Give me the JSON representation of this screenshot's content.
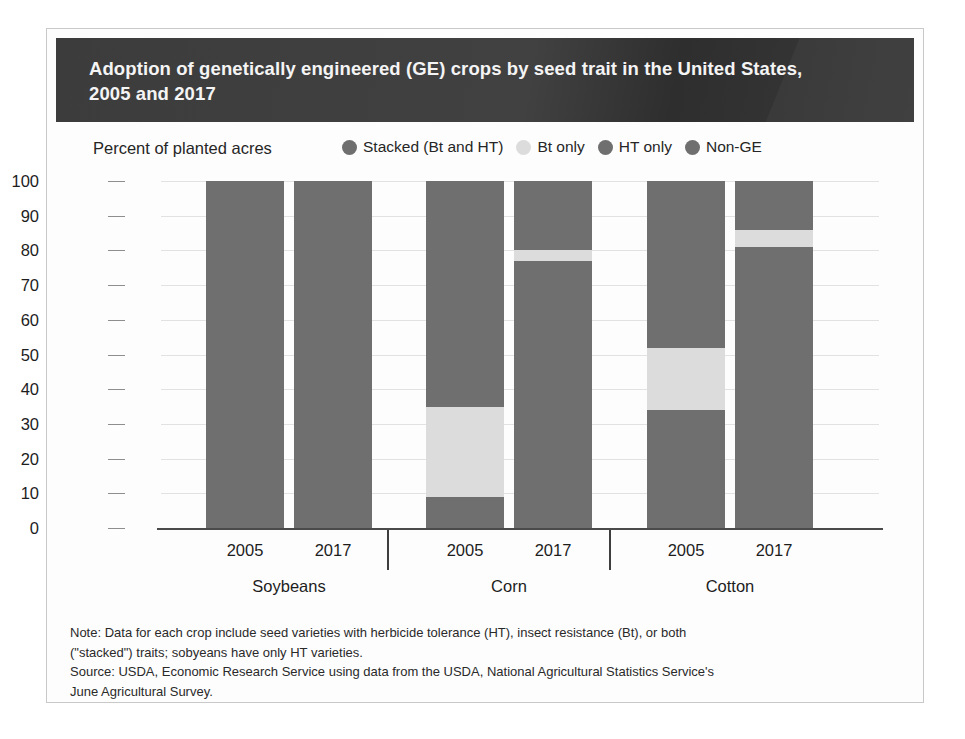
{
  "title": "Adoption of genetically engineered (GE) crops by seed trait in the United States,\n2005 and 2017",
  "axis_unit_label": "Percent of planted acres",
  "colors": {
    "stacked": "#6f6f6f",
    "bt_only": "#dcdcdc",
    "ht_only": "#6f6f6f",
    "non_ge": "#6f6f6f",
    "banner": "#3c3c3c",
    "gridline": "#e2e2e2",
    "axis": "#4a4a4a"
  },
  "legend": [
    {
      "label": "Stacked (Bt and HT)",
      "color": "#6f6f6f"
    },
    {
      "label": "Bt only",
      "color": "#dcdcdc"
    },
    {
      "label": "HT only",
      "color": "#6f6f6f"
    },
    {
      "label": "Non-GE",
      "color": "#6f6f6f"
    }
  ],
  "footnote": {
    "note": "Note: Data for each crop include seed varieties with herbicide tolerance (HT), insect resistance (Bt), or both\n(\"stacked\") traits; sobyeans have only HT varieties.",
    "source": "Source: USDA, Economic Research Service using data from the USDA, National Agricultural Statistics Service's\nJune Agricultural Survey."
  },
  "chart_data": {
    "type": "bar",
    "title": "Adoption of genetically engineered (GE) crops by seed trait in the United States, 2005 and 2017",
    "xlabel": "",
    "ylabel": "Percent of planted acres",
    "ylim": [
      0,
      100
    ],
    "yticks": [
      0,
      10,
      20,
      30,
      40,
      50,
      60,
      70,
      80,
      90,
      100
    ],
    "ytick_labels": [
      "0",
      "10",
      "20",
      "30",
      "40",
      "50",
      "60",
      "70",
      "80",
      "90",
      "100"
    ],
    "grid": true,
    "stacked": true,
    "legend_position": "top-right",
    "series": [
      {
        "name": "Stacked (Bt and HT)",
        "color": "#6f6f6f",
        "values": [
          0,
          0,
          9,
          77,
          34,
          81
        ]
      },
      {
        "name": "Bt only",
        "color": "#dcdcdc",
        "values": [
          0,
          0,
          26,
          3,
          18,
          5
        ]
      },
      {
        "name": "HT only",
        "color": "#6f6f6f",
        "values": [
          100,
          100,
          65,
          20,
          48,
          14
        ]
      },
      {
        "name": "Non-GE",
        "color": "#6f6f6f",
        "values": [
          0,
          0,
          0,
          0,
          0,
          0
        ]
      }
    ],
    "categories": [
      "2005",
      "2017",
      "2005",
      "2017",
      "2005",
      "2017"
    ],
    "groups": [
      {
        "label": "Soybeans",
        "years": [
          "2005",
          "2017"
        ]
      },
      {
        "label": "Corn",
        "years": [
          "2005",
          "2017"
        ]
      },
      {
        "label": "Cotton",
        "years": [
          "2005",
          "2017"
        ]
      }
    ],
    "bars": [
      {
        "group": "Soybeans",
        "year": "2005",
        "x": 45,
        "width": 78,
        "segments": [
          {
            "trait": "Stacked (Bt and HT)",
            "value": 0,
            "color": "#6f6f6f"
          },
          {
            "trait": "Bt only",
            "value": 0,
            "color": "#dcdcdc"
          },
          {
            "trait": "HT only",
            "value": 100,
            "color": "#6f6f6f"
          }
        ]
      },
      {
        "group": "Soybeans",
        "year": "2017",
        "x": 133,
        "width": 78,
        "segments": [
          {
            "trait": "Stacked (Bt and HT)",
            "value": 0,
            "color": "#6f6f6f"
          },
          {
            "trait": "Bt only",
            "value": 0,
            "color": "#dcdcdc"
          },
          {
            "trait": "HT only",
            "value": 100,
            "color": "#6f6f6f"
          }
        ]
      },
      {
        "group": "Corn",
        "year": "2005",
        "x": 265,
        "width": 78,
        "segments": [
          {
            "trait": "Stacked (Bt and HT)",
            "value": 9,
            "color": "#6f6f6f"
          },
          {
            "trait": "Bt only",
            "value": 26,
            "color": "#dcdcdc"
          },
          {
            "trait": "HT only",
            "value": 65,
            "color": "#6f6f6f"
          }
        ]
      },
      {
        "group": "Corn",
        "year": "2017",
        "x": 353,
        "width": 78,
        "segments": [
          {
            "trait": "Stacked (Bt and HT)",
            "value": 77,
            "color": "#6f6f6f"
          },
          {
            "trait": "Bt only",
            "value": 3,
            "color": "#dcdcdc"
          },
          {
            "trait": "HT only",
            "value": 20,
            "color": "#6f6f6f"
          }
        ]
      },
      {
        "group": "Cotton",
        "year": "2005",
        "x": 486,
        "width": 78,
        "segments": [
          {
            "trait": "Stacked (Bt and HT)",
            "value": 34,
            "color": "#6f6f6f"
          },
          {
            "trait": "Bt only",
            "value": 18,
            "color": "#dcdcdc"
          },
          {
            "trait": "HT only",
            "value": 48,
            "color": "#6f6f6f"
          }
        ]
      },
      {
        "group": "Cotton",
        "year": "2017",
        "x": 574,
        "width": 78,
        "segments": [
          {
            "trait": "Stacked (Bt and HT)",
            "value": 81,
            "color": "#6f6f6f"
          },
          {
            "trait": "Bt only",
            "value": 5,
            "color": "#dcdcdc"
          },
          {
            "trait": "HT only",
            "value": 14,
            "color": "#6f6f6f"
          }
        ]
      }
    ],
    "year_tick_x": [
      84,
      172,
      304,
      392,
      525,
      613
    ],
    "group_label_x": [
      128,
      348,
      569
    ],
    "group_divider_x": [
      226,
      448
    ]
  }
}
